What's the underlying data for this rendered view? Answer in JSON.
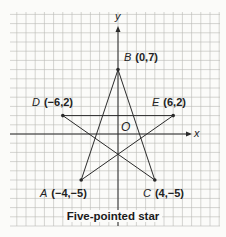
{
  "title": "Five-pointed star",
  "axes": {
    "x_label": "x",
    "y_label": "y",
    "origin_label": "O"
  },
  "points": [
    {
      "name": "A",
      "coords": "(−4,−5)",
      "x": -4,
      "y": -5
    },
    {
      "name": "B",
      "coords": "(0,7)",
      "x": 0,
      "y": 7
    },
    {
      "name": "C",
      "coords": "(4,−5)",
      "x": 4,
      "y": -5
    },
    {
      "name": "D",
      "coords": "(−6,2)",
      "x": -6,
      "y": 2
    },
    {
      "name": "E",
      "coords": "(6,2)",
      "x": 6,
      "y": 2
    }
  ],
  "segments": [
    [
      "A",
      "B"
    ],
    [
      "B",
      "C"
    ],
    [
      "C",
      "D"
    ],
    [
      "D",
      "E"
    ],
    [
      "E",
      "A"
    ]
  ],
  "colors": {
    "grid": "#b9b9b6",
    "line": "#2a2a2a",
    "text": "#222222",
    "background": "#fbfbf9"
  }
}
